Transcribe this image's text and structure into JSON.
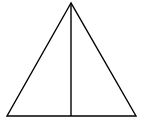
{
  "diagram": {
    "title": "",
    "stroke_color": "#000000",
    "background": "#ffffff",
    "stroke_width": 1.4,
    "apex": [
      71,
      3
    ],
    "base_left": [
      7,
      116
    ],
    "base_right": [
      136,
      116
    ],
    "altitude_foot": [
      71,
      116
    ]
  }
}
